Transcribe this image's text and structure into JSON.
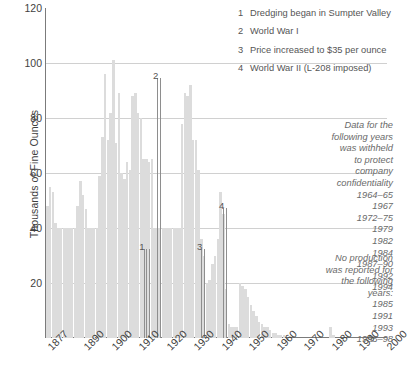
{
  "chart_data": {
    "type": "bar",
    "title": "",
    "xlabel": "",
    "ylabel": "Thousands of Fine Ounces",
    "ylim": [
      0,
      120
    ],
    "xlim": [
      1877,
      2000
    ],
    "grid": true,
    "legend_position": "right",
    "y_ticks": [
      0,
      20,
      40,
      60,
      80,
      100,
      120
    ],
    "y_tick_labels": [
      "0",
      "20",
      "40",
      "60",
      "80",
      "100",
      "120"
    ],
    "x_ticks": [
      1877,
      1890,
      1900,
      1910,
      1920,
      1930,
      1940,
      1950,
      1960,
      1970,
      1980,
      1990,
      2000
    ],
    "x_tick_labels": [
      "1877",
      "1890",
      "1900",
      "1910",
      "1920",
      "1930",
      "1940",
      "1950",
      "1960",
      "1970",
      "1980",
      "1990",
      "2000"
    ],
    "bar_color": "#dcdcdc",
    "categories": [
      1877,
      1878,
      1879,
      1880,
      1881,
      1882,
      1883,
      1884,
      1885,
      1886,
      1887,
      1888,
      1889,
      1890,
      1891,
      1892,
      1893,
      1894,
      1895,
      1896,
      1897,
      1898,
      1899,
      1900,
      1901,
      1902,
      1903,
      1904,
      1905,
      1906,
      1907,
      1908,
      1909,
      1910,
      1911,
      1912,
      1913,
      1914,
      1915,
      1916,
      1917,
      1918,
      1919,
      1920,
      1921,
      1922,
      1923,
      1924,
      1925,
      1926,
      1927,
      1928,
      1929,
      1930,
      1931,
      1932,
      1933,
      1934,
      1935,
      1936,
      1937,
      1938,
      1939,
      1940,
      1941,
      1942,
      1943,
      1944,
      1945,
      1946,
      1947,
      1948,
      1949,
      1950,
      1951,
      1952,
      1953,
      1954,
      1955,
      1956,
      1957,
      1958,
      1959,
      1960,
      1961,
      1962,
      1963,
      1964,
      1965,
      1966,
      1967,
      1968,
      1969,
      1970,
      1971,
      1972,
      1973,
      1974,
      1975,
      1976,
      1977,
      1978,
      1979,
      1980,
      1981,
      1982,
      1983,
      1984,
      1985,
      1986,
      1987,
      1988,
      1989,
      1990,
      1991,
      1992,
      1993,
      1994,
      1995,
      1996,
      1997,
      1998,
      1999,
      2000
    ],
    "values": [
      48,
      55,
      53,
      42,
      40,
      40,
      40,
      40,
      40,
      40,
      40,
      48,
      57,
      52,
      47,
      40,
      40,
      40,
      40,
      59,
      73,
      96,
      72,
      82,
      101,
      71,
      89,
      60,
      58,
      64,
      61,
      88,
      89,
      82,
      80,
      65,
      65,
      64,
      65,
      40,
      40,
      40,
      40,
      40,
      40,
      40,
      40,
      40,
      40,
      78,
      89,
      88,
      92,
      72,
      72,
      61,
      36,
      30,
      20,
      21,
      27,
      30,
      36,
      53,
      45,
      18,
      5,
      4,
      4,
      4,
      20,
      19,
      18,
      15,
      12,
      10,
      8,
      6,
      5,
      4,
      4,
      3,
      2,
      2,
      1,
      1,
      1,
      0,
      0,
      0,
      0,
      0,
      0,
      0,
      0,
      0,
      0,
      0,
      0,
      0,
      0,
      0,
      0,
      4,
      1,
      0,
      0,
      0,
      0,
      0,
      0,
      0,
      0,
      0,
      0,
      0,
      0,
      0,
      0,
      0,
      0,
      0,
      0,
      0
    ],
    "annotations": [
      {
        "id": "1",
        "year": 1913,
        "label_x_year": 1912,
        "label_value": 31,
        "leader_years": [
          1912,
          1913,
          1914
        ]
      },
      {
        "id": "2",
        "year": 1918,
        "label_x_year": 1917,
        "label_value": 93,
        "leader_years": [
          1917,
          1918
        ]
      },
      {
        "id": "3",
        "year": 1934,
        "label_x_year": 1933,
        "label_value": 31,
        "leader_years": [
          1933,
          1934
        ]
      },
      {
        "id": "4",
        "year": 1942,
        "label_x_year": 1941,
        "label_value": 46,
        "leader_years": [
          1941,
          1942
        ]
      }
    ]
  },
  "legend": {
    "numbered_notes": [
      {
        "num": "1",
        "text": "Dredging began in Sumpter Valley"
      },
      {
        "num": "2",
        "text": "World War I"
      },
      {
        "num": "3",
        "text": "Price increased to $35 per ounce"
      },
      {
        "num": "4",
        "text": "World War II (L-208 imposed)"
      }
    ]
  },
  "notes": {
    "withheld": {
      "heading_lines": [
        "Data for the",
        "following years",
        "was withheld",
        "to protect",
        "company",
        "confidentiality"
      ],
      "years": [
        "1964–65",
        "1967",
        "1972–75",
        "1979",
        "1982",
        "1984",
        "1987–90",
        "1992",
        "1994"
      ]
    },
    "no_production": {
      "heading_lines": [
        "No production",
        "was reported for",
        "the following",
        "years:"
      ],
      "years": [
        "1985",
        "1991",
        "1993",
        "1995–98"
      ]
    }
  },
  "colors": {
    "bar": "#dcdcdc",
    "grid": "#d0d0d0",
    "axis": "#7b7b7b",
    "text": "#3f3f3f",
    "note_text": "#6a6a6a"
  }
}
